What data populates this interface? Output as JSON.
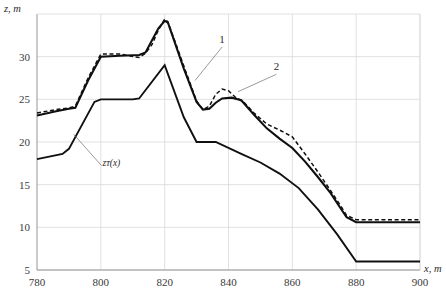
{
  "chart_data": {
    "type": "line",
    "title": "",
    "xlabel": "x, m",
    "ylabel": "z, m",
    "xlim": [
      780,
      900
    ],
    "ylim": [
      5,
      35
    ],
    "grid": true,
    "legend": "inline-annotations",
    "xticks": [
      780,
      800,
      820,
      840,
      860,
      880,
      900
    ],
    "yticks": [
      5,
      10,
      15,
      20,
      25,
      30
    ],
    "annotations": [
      {
        "text": "1",
        "x": 838,
        "y": 31.6
      },
      {
        "text": "2",
        "x": 855,
        "y": 28.4
      },
      {
        "text": "zᴛ(x)",
        "x": 800.5,
        "y": 17.2
      }
    ],
    "series": [
      {
        "name": "1",
        "style": "solid",
        "x": [
          780,
          786,
          790,
          792,
          796,
          800,
          806,
          812,
          814,
          818,
          820,
          821,
          826,
          830,
          832,
          834,
          836,
          838,
          841,
          844,
          848,
          852,
          856,
          860,
          864,
          868,
          872,
          875,
          877,
          880,
          884,
          890,
          900
        ],
        "y": [
          23.1,
          23.6,
          23.9,
          24.0,
          27.2,
          30.0,
          30.1,
          30.2,
          30.5,
          33.3,
          34.2,
          34.0,
          28.6,
          24.7,
          23.8,
          23.9,
          24.6,
          25.1,
          25.2,
          24.9,
          23.2,
          21.6,
          20.4,
          19.3,
          17.7,
          15.9,
          14.0,
          12.3,
          11.2,
          10.6,
          10.6,
          10.6,
          10.6
        ]
      },
      {
        "name": "2",
        "style": "dashed",
        "x": [
          780,
          786,
          790,
          792,
          796,
          800,
          806,
          812,
          814,
          816,
          818,
          820,
          821,
          826,
          830,
          832,
          834,
          836,
          838,
          840,
          842,
          845,
          848,
          852,
          856,
          860,
          864,
          868,
          872,
          875,
          877,
          880,
          884,
          890,
          900
        ],
        "y": [
          23.4,
          23.8,
          24.0,
          24.2,
          27.5,
          30.3,
          30.3,
          29.9,
          30.4,
          31.4,
          33.1,
          34.4,
          34.1,
          28.9,
          24.8,
          23.8,
          24.2,
          25.6,
          26.2,
          26.0,
          25.3,
          24.6,
          23.4,
          22.1,
          21.4,
          20.6,
          18.6,
          16.5,
          14.3,
          12.6,
          11.4,
          10.9,
          10.9,
          10.9,
          10.9
        ]
      },
      {
        "name": "zᴛ(x)",
        "style": "solid",
        "x": [
          780,
          788,
          790,
          798,
          800,
          810,
          812,
          820,
          826,
          830,
          836,
          844,
          850,
          856,
          862,
          868,
          874,
          880,
          890,
          900
        ],
        "y": [
          18.0,
          18.6,
          19.2,
          24.7,
          25.0,
          25.0,
          25.1,
          29.0,
          22.9,
          20.0,
          20.0,
          18.6,
          17.6,
          16.3,
          14.6,
          12.1,
          9.2,
          6.0,
          6.0,
          6.0
        ]
      }
    ]
  },
  "axis": {
    "y_title": "z, m",
    "x_title": "x, m"
  }
}
